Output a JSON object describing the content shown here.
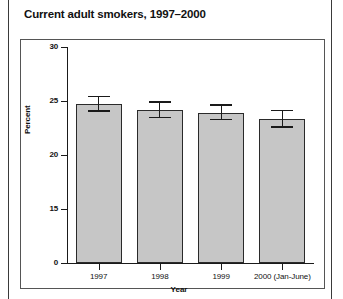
{
  "chart_data": {
    "type": "bar",
    "title": "Current adult smokers, 1997–2000",
    "xlabel": "Year",
    "ylabel": "Percent",
    "categories": [
      "1997",
      "1998",
      "1999",
      "2000 (Jan-June)"
    ],
    "values": [
      24.7,
      24.2,
      23.9,
      23.3
    ],
    "errors_low": [
      24.0,
      23.4,
      23.2,
      22.5
    ],
    "errors_high": [
      25.5,
      25.0,
      24.7,
      24.2
    ],
    "ytick_labels": [
      "30",
      "25",
      "20",
      "15",
      "0"
    ],
    "ytick_values": [
      30,
      25,
      20,
      15,
      0
    ],
    "ylim": [
      0,
      30
    ],
    "grid": false,
    "legend": false,
    "bar_color": "#c6c6c6",
    "bar_edge_color": "#2a2a2a",
    "error_bar_color": "#1a1a1a",
    "axis_color": "#1a1a1a",
    "axis_note": "broken y-axis: ticks 30,25,20,15 then 0 evenly spaced"
  }
}
